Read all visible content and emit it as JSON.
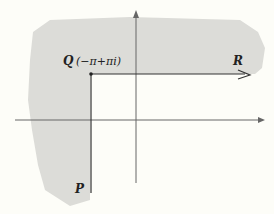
{
  "diagram": {
    "points": {
      "Q": {
        "label": "Q",
        "coordinate": "(−π+πi)"
      },
      "R": {
        "label": "R"
      },
      "P": {
        "label": "P"
      }
    },
    "colors": {
      "background": "#fdfdf8",
      "shaded_region": "#dcdcd8",
      "lines": "#333333",
      "axes": "#555555"
    }
  }
}
